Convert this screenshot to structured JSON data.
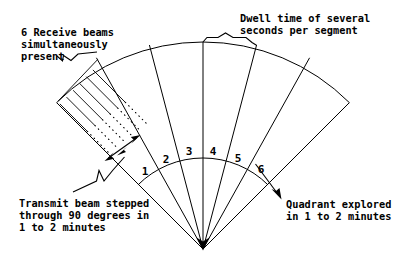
{
  "figure": {
    "type": "radar-beam-scan-diagram",
    "background_color": "#ffffff",
    "line_color": "#000000"
  },
  "annotations": {
    "receive_beams": {
      "name": "receive-beams-note",
      "line1": "6 Receive beams",
      "line2": "simultaneously",
      "line3": "present"
    },
    "dwell_time": {
      "name": "dwell-time-note",
      "line1": "Dwell time of several",
      "line2": "seconds per segment"
    },
    "transmit_beam": {
      "name": "transmit-beam-note",
      "line1": "Transmit beam stepped",
      "line2": "through 90 degrees in",
      "line3": "1 to 2 minutes"
    },
    "quadrant": {
      "name": "quadrant-note",
      "line1": "Quadrant explored",
      "line2": "in 1 to 2 minutes"
    }
  },
  "segments": {
    "count": 6,
    "labels": [
      "1",
      "2",
      "3",
      "4",
      "5",
      "6"
    ],
    "label_positions": [
      {
        "x": 145,
        "y": 175
      },
      {
        "x": 166,
        "y": 163
      },
      {
        "x": 189,
        "y": 155
      },
      {
        "x": 213,
        "y": 155
      },
      {
        "x": 238,
        "y": 162
      },
      {
        "x": 261,
        "y": 173
      }
    ]
  },
  "geometry": {
    "apex": {
      "x": 203,
      "y": 249
    },
    "outer_radius": 207,
    "inner_radius": 92,
    "start_angle_deg": -135,
    "end_angle_deg": -45,
    "total_sweep_deg": 90,
    "receive_beam_lines": 6
  }
}
